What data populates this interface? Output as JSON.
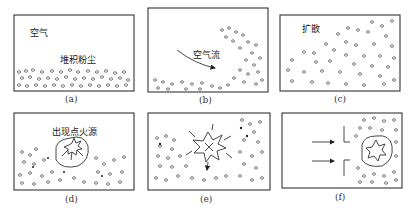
{
  "figure": {
    "panels": [
      {
        "id": "a",
        "caption": "(a)",
        "labels": [
          "空气",
          "堆积粉尘"
        ]
      },
      {
        "id": "b",
        "caption": "(b)",
        "labels": [
          "空气流"
        ]
      },
      {
        "id": "c",
        "caption": "(c)",
        "labels": [
          "扩散"
        ]
      },
      {
        "id": "d",
        "caption": "(d)",
        "labels": [
          "出现点火源"
        ]
      },
      {
        "id": "e",
        "caption": "(e)",
        "labels": []
      },
      {
        "id": "f",
        "caption": "(f)",
        "labels": []
      }
    ]
  }
}
